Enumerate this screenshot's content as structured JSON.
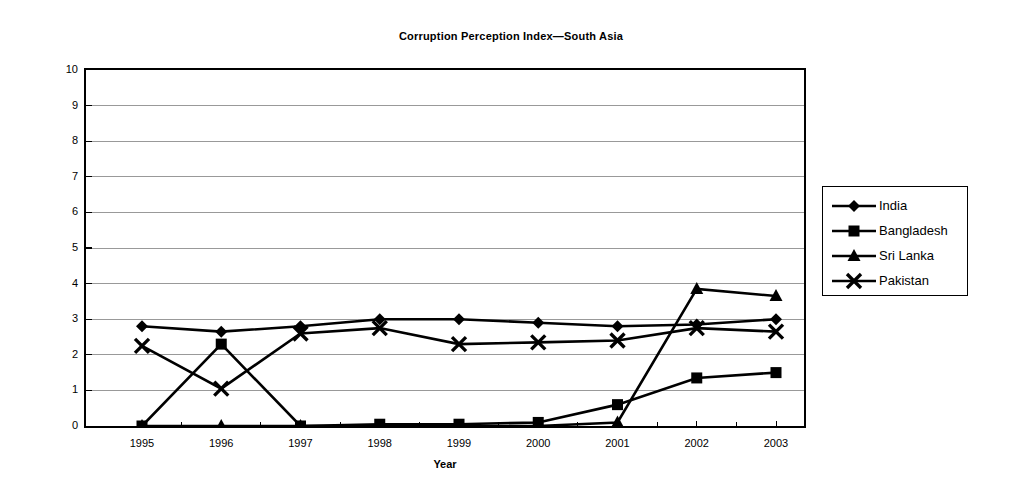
{
  "chart_data": {
    "type": "line",
    "title": "Corruption Perception Index—South Asia",
    "xlabel": "Year",
    "ylabel": "Index- more is better",
    "categories": [
      "1995",
      "1996",
      "1997",
      "1998",
      "1999",
      "2000",
      "2001",
      "2002",
      "2003"
    ],
    "x": [
      1995,
      1996,
      1997,
      1998,
      1999,
      2000,
      2001,
      2002,
      2003
    ],
    "ylim": [
      0,
      10
    ],
    "yticks": [
      0,
      1,
      2,
      3,
      4,
      5,
      6,
      7,
      8,
      9,
      10
    ],
    "grid": "horizontal",
    "legend_position": "right",
    "series": [
      {
        "name": "India",
        "marker": "diamond",
        "color": "#000000",
        "values": [
          2.8,
          2.65,
          2.8,
          3.0,
          3.0,
          2.9,
          2.8,
          2.85,
          3.0
        ]
      },
      {
        "name": "Bangladesh",
        "marker": "square",
        "color": "#000000",
        "values": [
          0.0,
          2.3,
          0.0,
          0.05,
          0.05,
          0.1,
          0.6,
          1.35,
          1.5
        ]
      },
      {
        "name": "Sri Lanka",
        "marker": "triangle",
        "color": "#000000",
        "values": [
          0.0,
          0.0,
          0.0,
          0.0,
          0.0,
          0.0,
          0.1,
          3.85,
          3.65
        ]
      },
      {
        "name": "Pakistan",
        "marker": "cross",
        "color": "#000000",
        "values": [
          2.25,
          1.05,
          2.6,
          2.75,
          2.3,
          2.35,
          2.4,
          2.75,
          2.65
        ]
      }
    ]
  },
  "axis": {
    "y_tick_labels": [
      "10",
      "9",
      "8",
      "7",
      "6",
      "5",
      "4",
      "3",
      "2",
      "1",
      "0"
    ],
    "x_tick_labels": [
      "1995",
      "1996",
      "1997",
      "1998",
      "1999",
      "2000",
      "2001",
      "2002",
      "2003"
    ],
    "y_title": "Index- more is better",
    "x_title": "Year"
  },
  "legend": {
    "items": [
      {
        "label": "India",
        "marker": "diamond"
      },
      {
        "label": "Bangladesh",
        "marker": "square"
      },
      {
        "label": "Sri Lanka",
        "marker": "triangle"
      },
      {
        "label": "Pakistan",
        "marker": "cross"
      }
    ]
  },
  "colors": {
    "series": "#000000",
    "grid": "#808080",
    "frame": "#000000",
    "background": "#ffffff"
  }
}
